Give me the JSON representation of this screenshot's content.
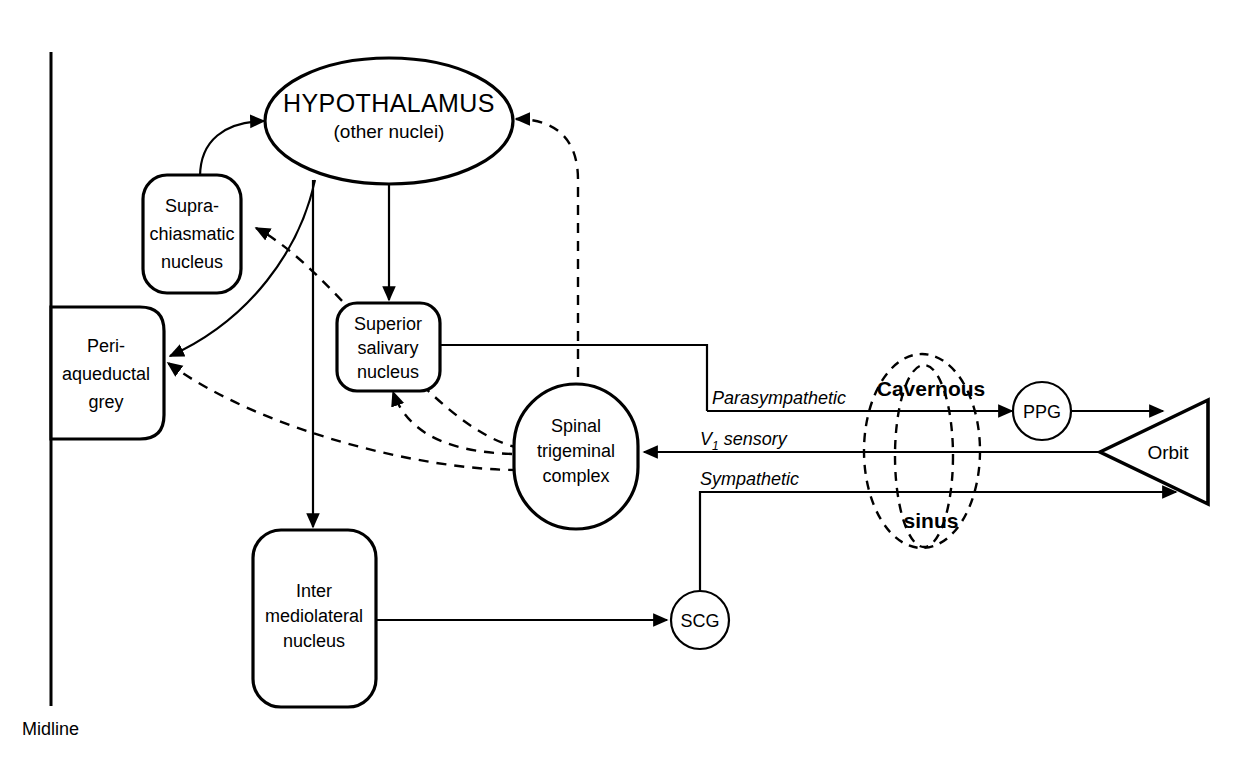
{
  "diagram": {
    "midline_label": "Midline",
    "nodes": [
      {
        "id": "hypothalamus",
        "label_main": "HYPOTHALAMUS",
        "label_sub": "(other nuclei)",
        "shape": "ellipse"
      },
      {
        "id": "suprachiasmatic",
        "lines": [
          "Supra-",
          "chiasmatic",
          "nucleus"
        ],
        "shape": "rounded-rect"
      },
      {
        "id": "periaqueductal",
        "lines": [
          "Peri-",
          "aqueductal",
          "grey"
        ],
        "shape": "rounded-rect-midline"
      },
      {
        "id": "superior-salivary",
        "lines": [
          "Superior",
          "salivary",
          "nucleus"
        ],
        "shape": "rounded-rect"
      },
      {
        "id": "spinal-trigeminal",
        "lines": [
          "Spinal",
          "trigeminal",
          "complex"
        ],
        "shape": "stadium"
      },
      {
        "id": "intermediolateral",
        "lines": [
          "Inter",
          "mediolateral",
          "nucleus"
        ],
        "shape": "rounded-rect"
      },
      {
        "id": "scg",
        "label": "SCG",
        "shape": "circle"
      },
      {
        "id": "ppg",
        "label": "PPG",
        "shape": "circle"
      },
      {
        "id": "orbit",
        "label": "Orbit",
        "shape": "triangle"
      }
    ],
    "region": {
      "id": "cavernous-sinus",
      "label_top": "Cavernous",
      "label_bottom": "sinus",
      "style": "dashed-ellipses"
    },
    "pathway_labels": [
      {
        "id": "parasympathetic",
        "text": "Parasympathetic"
      },
      {
        "id": "v1-sensory",
        "text": "V",
        "subscript": "1",
        "suffix": " sensory"
      },
      {
        "id": "sympathetic",
        "text": "Sympathetic"
      }
    ],
    "colors": {
      "stroke": "#000000",
      "fill": "#ffffff",
      "background": "#ffffff"
    }
  }
}
